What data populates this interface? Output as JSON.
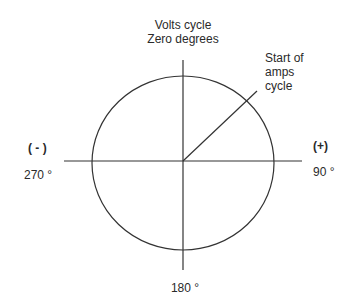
{
  "diagram": {
    "type": "phasor-circle",
    "colors": {
      "line": "#333333",
      "text": "#2a2a2a",
      "background": "#ffffff"
    },
    "geometry": {
      "center": [
        183,
        161
      ],
      "circle_rx": 91,
      "circle_ry": 87,
      "vertical_axis": {
        "y1": 60,
        "y2": 270
      },
      "horizontal_axis": {
        "x1": 64,
        "x2": 302
      },
      "amps_vector_end": [
        257,
        91
      ]
    },
    "labels": {
      "top_line1": "Volts cycle",
      "top_line2": "Zero degrees",
      "amps_line1": "Start of",
      "amps_line2": "amps",
      "amps_line3": "cycle",
      "left_sign": "( - )",
      "left_degrees": "270 °",
      "right_sign": "(+)",
      "right_degrees": "90 °",
      "bottom_degrees": "180 °"
    }
  }
}
